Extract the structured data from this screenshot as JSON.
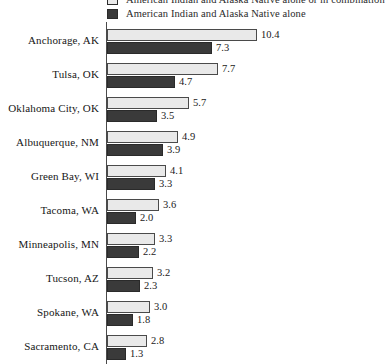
{
  "chart_data": {
    "type": "bar",
    "orientation": "horizontal",
    "title": "",
    "xlabel": "",
    "ylabel": "",
    "grid": false,
    "legend_position": "top",
    "xlim": [
      0,
      10.4
    ],
    "categories": [
      "Anchorage, AK",
      "Tulsa, OK",
      "Oklahoma City, OK",
      "Albuquerque, NM",
      "Green Bay, WI",
      "Tacoma, WA",
      "Minneapolis, MN",
      "Tucson, AZ",
      "Spokane, WA",
      "Sacramento, CA"
    ],
    "series": [
      {
        "name": "American Indian and Alaska Native alone or in combination",
        "color": "#e9e9e9",
        "values": [
          10.4,
          7.7,
          5.7,
          4.9,
          4.1,
          3.6,
          3.3,
          3.2,
          3.0,
          2.8
        ],
        "labels": [
          "10.4",
          "7.7",
          "5.7",
          "4.9",
          "4.1",
          "3.6",
          "3.3",
          "3.2",
          "3.0",
          "2.8"
        ]
      },
      {
        "name": "American Indian  and Alaska Native alone",
        "color": "#3a3a3a",
        "values": [
          7.3,
          4.7,
          3.5,
          3.9,
          3.3,
          2.0,
          2.2,
          2.3,
          1.8,
          1.3
        ],
        "labels": [
          "7.3",
          "4.7",
          "3.5",
          "3.9",
          "3.3",
          "2.0",
          "2.2",
          "2.3",
          "1.8",
          "1.3"
        ]
      }
    ]
  },
  "legend": {
    "items": [
      {
        "label": "American Indian and Alaska Native alone or in combination",
        "swatch": "light-swatch-icon"
      },
      {
        "label": "American Indian  and Alaska Native alone",
        "swatch": "dark-swatch-icon"
      }
    ]
  },
  "scale": {
    "px_per_unit": 14.4,
    "axis_left_px": 107
  }
}
